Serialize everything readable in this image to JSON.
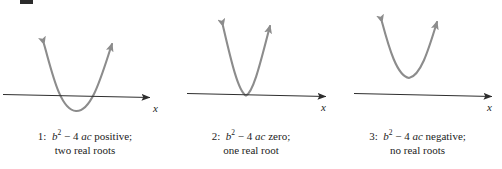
{
  "figure": {
    "background_color": "#ffffff",
    "axis_color": "#2e2e2e",
    "curve_color": "#8c8c8c",
    "text_color": "#1c1c1c",
    "axis_label": "x"
  },
  "panels": [
    {
      "id": "1",
      "number_label": "1:",
      "expression": {
        "base": "b",
        "exponent": "2",
        "operator": "−",
        "coefficient": "4",
        "product": "ac"
      },
      "discriminant_word": "positive;",
      "roots_text": "two real roots",
      "caption_line1": "1:  b2 − 4 ac positive;",
      "caption_line2": "two real roots",
      "curve": {
        "vertex_relation": "below-axis",
        "intersections": 2
      }
    },
    {
      "id": "2",
      "number_label": "2:",
      "expression": {
        "base": "b",
        "exponent": "2",
        "operator": "−",
        "coefficient": "4",
        "product": "ac"
      },
      "discriminant_word": "zero;",
      "roots_text": "one real root",
      "caption_line1": "2:  b2 − 4 ac zero;",
      "caption_line2": "one real root",
      "curve": {
        "vertex_relation": "on-axis",
        "intersections": 1
      }
    },
    {
      "id": "3",
      "number_label": "3:",
      "expression": {
        "base": "b",
        "exponent": "2",
        "operator": "−",
        "coefficient": "4",
        "product": "ac"
      },
      "discriminant_word": "negative;",
      "roots_text": "no real roots",
      "caption_line1": "3:  b2 − 4 ac negative;",
      "caption_line2": "no real roots",
      "curve": {
        "vertex_relation": "above-axis",
        "intersections": 0
      }
    }
  ]
}
